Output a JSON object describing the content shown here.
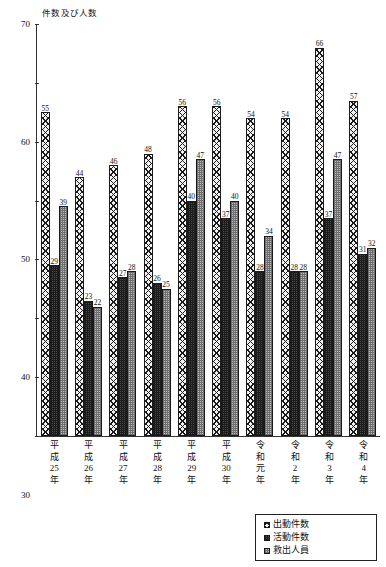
{
  "chart_data": {
    "type": "bar",
    "title": "",
    "subtitle": "",
    "xlabel": "",
    "ylabel": "件数及び人数",
    "ylim": [
      0,
      70
    ],
    "ytick_step": 10,
    "yticks": [
      "0",
      "10",
      "20",
      "30",
      "40",
      "50",
      "60",
      "70"
    ],
    "grid": false,
    "legend_position": "bottom-right",
    "categories": [
      "平成25年",
      "平成26年",
      "平成27年",
      "平成28年",
      "平成29年",
      "平成30年",
      "令和元年",
      "令和2年",
      "令和3年",
      "令和4年"
    ],
    "category_lines": [
      [
        "平",
        "成",
        "25",
        "年"
      ],
      [
        "平",
        "成",
        "26",
        "年"
      ],
      [
        "平",
        "成",
        "27",
        "年"
      ],
      [
        "平",
        "成",
        "28",
        "年"
      ],
      [
        "平",
        "成",
        "29",
        "年"
      ],
      [
        "平",
        "成",
        "30",
        "年"
      ],
      [
        "令",
        "和",
        "元",
        "年"
      ],
      [
        "令",
        "和",
        "2",
        "年"
      ],
      [
        "令",
        "和",
        "3",
        "年"
      ],
      [
        "令",
        "和",
        "4",
        "年"
      ]
    ],
    "series": [
      {
        "name": "出動件数",
        "pattern": "diagonal-crosshatch",
        "values": [
          55,
          44,
          46,
          48,
          56,
          56,
          54,
          54,
          66,
          57
        ]
      },
      {
        "name": "活動件数",
        "pattern": "dark-dense",
        "values": [
          29,
          23,
          27,
          26,
          40,
          37,
          28,
          28,
          37,
          31
        ]
      },
      {
        "name": "救出人員",
        "pattern": "medium-checker",
        "values": [
          39,
          22,
          28,
          25,
          47,
          40,
          34,
          28,
          47,
          32
        ]
      }
    ]
  },
  "legend": {
    "items": [
      {
        "label": "出動件数"
      },
      {
        "label": "活動件数"
      },
      {
        "label": "救出人員"
      }
    ]
  },
  "colors": {
    "axis": "#333333",
    "bar_outline": "#1a1a1a",
    "series1_fill": "#f2f2f2",
    "series2_fill": "#4a4a4a",
    "series3_fill": "#bdbdbd",
    "background": "#ffffff"
  }
}
